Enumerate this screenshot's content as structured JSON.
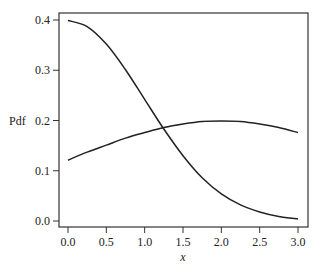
{
  "chart_data": {
    "type": "line",
    "title": "",
    "xlabel": "x",
    "ylabel": "Pdf",
    "xlim": [
      0.0,
      3.0
    ],
    "ylim": [
      0.0,
      0.4
    ],
    "xticks": [
      "0.0",
      "0.5",
      "1.0",
      "1.5",
      "2.0",
      "2.5",
      "3.0"
    ],
    "yticks": [
      "0.0",
      "0.1",
      "0.2",
      "0.3",
      "0.4"
    ],
    "grid": false,
    "legend": null,
    "x": [
      0.0,
      0.25,
      0.5,
      0.75,
      1.0,
      1.25,
      1.5,
      1.75,
      2.0,
      2.25,
      2.5,
      2.75,
      3.0
    ],
    "series": [
      {
        "name": "curve-decreasing",
        "values": [
          0.399,
          0.387,
          0.352,
          0.301,
          0.242,
          0.183,
          0.13,
          0.086,
          0.054,
          0.032,
          0.018,
          0.009,
          0.004
        ]
      },
      {
        "name": "curve-hump",
        "values": [
          0.121,
          0.137,
          0.151,
          0.165,
          0.176,
          0.186,
          0.193,
          0.198,
          0.199,
          0.198,
          0.193,
          0.186,
          0.176
        ]
      }
    ]
  }
}
